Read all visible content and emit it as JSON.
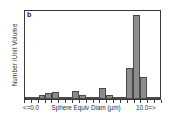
{
  "chart_data": {
    "type": "bar",
    "title": "",
    "panel_label": "b",
    "xlabel": "Sphere Equiv Diam (µm)",
    "ylabel": "Number /Unit Volume",
    "xtick_labels": [
      "<=0.0",
      "10.0=>"
    ],
    "grid": false,
    "legend": null,
    "ylim": [
      0,
      100
    ],
    "categories": [
      "bin1",
      "bin2",
      "bin3",
      "bin4",
      "bin5",
      "bin6",
      "bin7",
      "bin8",
      "bin9",
      "bin10",
      "bin11",
      "bin12",
      "bin13",
      "bin14",
      "bin15",
      "bin16",
      "bin17",
      "bin18",
      "bin19",
      "bin20"
    ],
    "values": [
      1,
      1,
      5,
      7,
      8,
      2,
      2,
      9,
      5,
      2,
      2,
      13,
      5,
      1,
      2,
      35,
      96,
      25,
      1,
      1
    ],
    "bar_color": "#8c8c8c",
    "bar_edge_color": "#4a4a4a",
    "axis_color": "#3a3a3a"
  }
}
